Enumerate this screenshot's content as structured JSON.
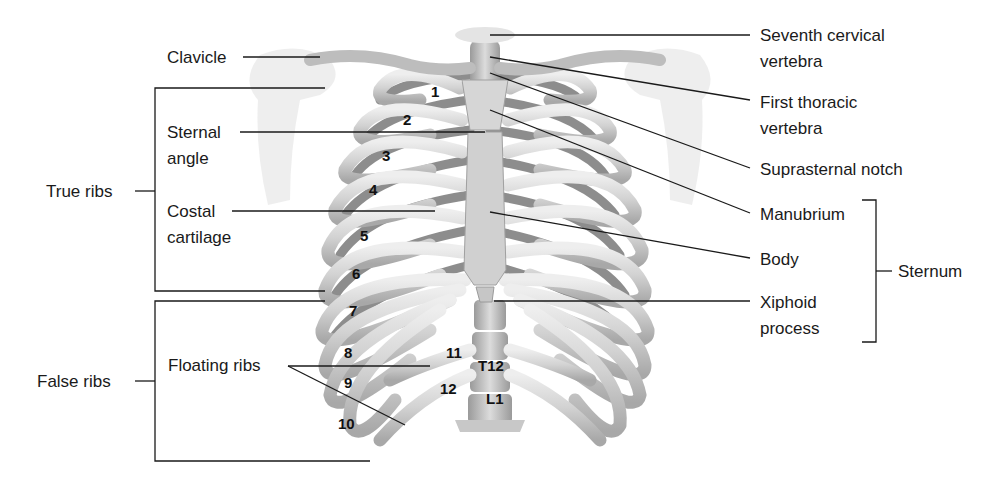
{
  "figure": {
    "labels_left": {
      "clavicle": "Clavicle",
      "sternal_angle_1": "Sternal",
      "sternal_angle_2": "angle",
      "costal_cartilage_1": "Costal",
      "costal_cartilage_2": "cartilage",
      "floating_ribs": "Floating ribs"
    },
    "groups_left": {
      "true_ribs": "True ribs",
      "false_ribs": "False ribs"
    },
    "labels_right": {
      "seventh_cervical_1": "Seventh cervical",
      "seventh_cervical_2": "vertebra",
      "first_thoracic_1": "First thoracic",
      "first_thoracic_2": "vertebra",
      "suprasternal_notch": "Suprasternal notch",
      "manubrium": "Manubrium",
      "body": "Body",
      "xiphoid_1": "Xiphoid",
      "xiphoid_2": "process"
    },
    "groups_right": {
      "sternum": "Sternum"
    },
    "rib_numbers": [
      "1",
      "2",
      "3",
      "4",
      "5",
      "6",
      "7",
      "8",
      "9",
      "10",
      "11",
      "12"
    ],
    "vertebra_labels": {
      "t12": "T12",
      "l1": "L1"
    },
    "colors": {
      "bone": "#d9d9d9",
      "bone_shadow": "#8a8a8a",
      "cartilage": "#c8c8c8",
      "leader_line": "#1a1a1a",
      "background": "#ffffff"
    }
  }
}
